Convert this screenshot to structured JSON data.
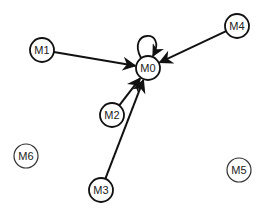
{
  "diagram": {
    "type": "directed-graph",
    "colors": {
      "stroke": "#111111",
      "node_fill": "#ffffff",
      "label": "#222222",
      "isolated_stroke": "#333333"
    },
    "nodes": [
      {
        "id": "M0",
        "label": "M0",
        "x": 148,
        "y": 68,
        "r": 12,
        "connected": true
      },
      {
        "id": "M1",
        "label": "M1",
        "x": 42,
        "y": 50,
        "r": 12,
        "connected": true
      },
      {
        "id": "M2",
        "label": "M2",
        "x": 112,
        "y": 115,
        "r": 12,
        "connected": true
      },
      {
        "id": "M3",
        "label": "M3",
        "x": 101,
        "y": 190,
        "r": 12,
        "connected": true
      },
      {
        "id": "M4",
        "label": "M4",
        "x": 237,
        "y": 26,
        "r": 12,
        "connected": true
      },
      {
        "id": "M5",
        "label": "M5",
        "x": 239,
        "y": 170,
        "r": 12,
        "connected": false
      },
      {
        "id": "M6",
        "label": "M6",
        "x": 26,
        "y": 156,
        "r": 12,
        "connected": false
      }
    ],
    "edges": [
      {
        "from": "M0",
        "to": "M0",
        "self_loop": true
      },
      {
        "from": "M1",
        "to": "M0"
      },
      {
        "from": "M4",
        "to": "M0"
      },
      {
        "from": "M2",
        "to": "M0"
      },
      {
        "from": "M3",
        "to": "M0"
      }
    ]
  }
}
